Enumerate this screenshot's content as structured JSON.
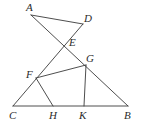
{
  "figure": {
    "kind": "geometry-diagram",
    "canvas": {
      "width": 141,
      "height": 130
    },
    "stroke_color": "#3a3a3a",
    "label_color": "#2b2b2b",
    "background_color": "#ffffff",
    "points": [
      {
        "id": "A",
        "label": "A",
        "x": 31,
        "y": 15,
        "label_x": 26,
        "label_y": 2
      },
      {
        "id": "D",
        "label": "D",
        "x": 83,
        "y": 24,
        "label_x": 84,
        "label_y": 13
      },
      {
        "id": "E",
        "label": "E",
        "x": 66,
        "y": 42,
        "label_x": 69,
        "label_y": 37
      },
      {
        "id": "G",
        "label": "G",
        "x": 86,
        "y": 65,
        "label_x": 86,
        "label_y": 53
      },
      {
        "id": "F",
        "label": "F",
        "x": 36,
        "y": 78,
        "label_x": 26,
        "label_y": 69
      },
      {
        "id": "C",
        "label": "C",
        "x": 13,
        "y": 106,
        "label_x": 9,
        "label_y": 110
      },
      {
        "id": "H",
        "label": "H",
        "x": 53,
        "y": 106,
        "label_x": 49,
        "label_y": 110
      },
      {
        "id": "K",
        "label": "K",
        "x": 84,
        "y": 106,
        "label_x": 79,
        "label_y": 110
      },
      {
        "id": "B",
        "label": "B",
        "x": 128,
        "y": 106,
        "label_x": 124,
        "label_y": 110
      }
    ],
    "segments": [
      {
        "id": "AD",
        "name": "segment-a-d",
        "from": "A",
        "to": "D"
      },
      {
        "id": "AB",
        "name": "segment-a-through-e-g-to-b",
        "from": "A",
        "to": "B"
      },
      {
        "id": "DC",
        "name": "segment-d-through-e-f-to-c",
        "from": "D",
        "to": "C"
      },
      {
        "id": "FG",
        "name": "segment-f-g",
        "from": "F",
        "to": "G"
      },
      {
        "id": "FH",
        "name": "segment-f-h",
        "from": "F",
        "to": "H"
      },
      {
        "id": "GK",
        "name": "segment-g-k",
        "from": "G",
        "to": "K"
      },
      {
        "id": "CB",
        "name": "segment-c-b-baseline",
        "from": "C",
        "to": "B"
      }
    ]
  }
}
